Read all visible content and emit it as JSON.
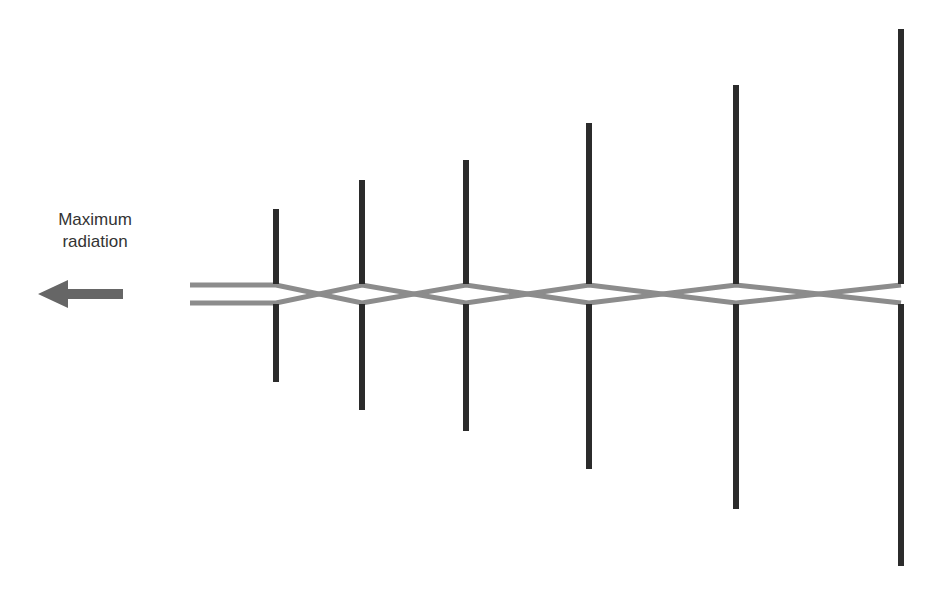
{
  "diagram": {
    "label": {
      "line1": "Maximum",
      "line2": "radiation"
    },
    "arrow": {
      "direction": "left",
      "color": "#666666",
      "tip_x": 38,
      "tail_x": 123,
      "y": 294
    },
    "feed_line": {
      "color": "#8c8c8c",
      "top_y": 285,
      "bottom_y": 303,
      "start_x": 190
    },
    "element_color": "#2b2b2b",
    "elements": [
      {
        "x": 276,
        "top": 209,
        "bottom": 382
      },
      {
        "x": 362,
        "top": 180,
        "bottom": 410
      },
      {
        "x": 466,
        "top": 160,
        "bottom": 431
      },
      {
        "x": 589,
        "top": 123,
        "bottom": 469
      },
      {
        "x": 736,
        "top": 85,
        "bottom": 509
      },
      {
        "x": 901,
        "top": 29,
        "bottom": 566
      }
    ]
  }
}
